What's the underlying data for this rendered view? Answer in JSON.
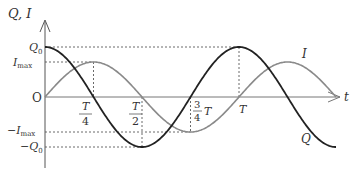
{
  "diagram": {
    "y_axis_label": "Q, I",
    "x_axis_label": "t",
    "origin_label": "O",
    "y_ticks": {
      "q0": "Q0",
      "imax": "Imax",
      "neg_imax": "−Imax",
      "neg_q0": "−Q0"
    },
    "x_ticks": {
      "quarter_num": "T",
      "quarter_den": "4",
      "half_num": "T",
      "half_den": "2",
      "three_quarter_num": "3",
      "three_quarter_den": "4",
      "three_quarter_suffix": "T",
      "full": "T"
    },
    "curves": [
      {
        "name": "Q",
        "label": "Q",
        "function": "Q0 cos(2πt/T)",
        "amplitude": "Q0",
        "color": "#222222"
      },
      {
        "name": "I",
        "label": "I",
        "function": "Imax sin(2πt/T)",
        "amplitude": "Imax",
        "color": "#888888"
      }
    ],
    "t_range_periods": [
      0,
      1.5
    ],
    "amplitude_ratio_imax_over_q0": 0.7
  }
}
